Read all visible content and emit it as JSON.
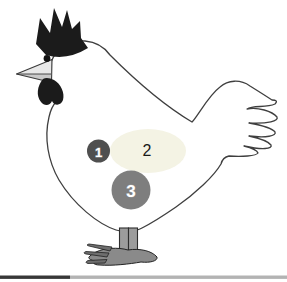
{
  "diagram": {
    "regions": [
      {
        "label": "1",
        "color": "#4f4f4f",
        "label_color": "#ffffff"
      },
      {
        "label": "2",
        "color": "#f4f3e4",
        "label_color": "#1a1a1a"
      },
      {
        "label": "3",
        "color": "#7e7e7e",
        "label_color": "#ffffff"
      }
    ],
    "colors": {
      "background": "#ffffff",
      "body_fill": "#ffffff",
      "outline": "#3f3f3f",
      "comb": "#1b1b1b",
      "wattle": "#1b1b1b",
      "eye": "#111111",
      "beak_upper": "#e8e8e8",
      "beak_lower": "#c9c9c9",
      "leg_fill": "#9c9c9c",
      "foot_fill": "#8a8a8a",
      "claw_fill": "#6e6e6e",
      "bar_left": "#383838",
      "bar_right": "#b3b3b3"
    },
    "icons": [
      "chicken-illustration"
    ]
  }
}
